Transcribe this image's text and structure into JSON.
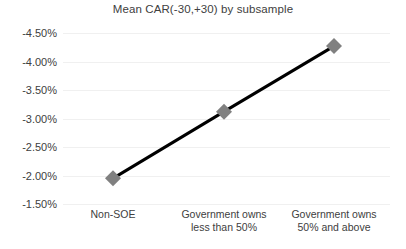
{
  "chart_data": {
    "type": "line",
    "title": "Mean CAR(-30,+30) by subsample",
    "xlabel": "",
    "ylabel": "",
    "categories": [
      "Non-SOE",
      "Government owns less than 50%",
      "Government owns 50% and above"
    ],
    "category_lines": [
      [
        "Non-SOE"
      ],
      [
        "Government owns",
        "less than 50%"
      ],
      [
        "Government owns",
        "50% and above"
      ]
    ],
    "values": [
      -1.95,
      -3.12,
      -4.27
    ],
    "value_labels": [
      "-1.95%",
      "-3.12%",
      "-4.27%"
    ],
    "ylim": [
      -4.5,
      -1.5
    ],
    "ytick_values": [
      -1.5,
      -2.0,
      -2.5,
      -3.0,
      -3.5,
      -4.0,
      -4.5
    ],
    "ytick_labels": [
      "-1.50%",
      "-2.00%",
      "-2.50%",
      "-3.00%",
      "-3.50%",
      "-4.00%",
      "-4.50%"
    ],
    "grid": true,
    "legend": false,
    "legend_position": "none",
    "series": [
      {
        "name": "Mean CAR(-30,+30)",
        "values": [
          -1.95,
          -3.12,
          -4.27
        ],
        "line_color": "#000000",
        "marker_color": "#808080",
        "marker_shape": "diamond"
      }
    ],
    "colors": {
      "line": "#000000",
      "marker": "#808080",
      "gridline": "#f0f0f0",
      "text": "#404040",
      "background": "#ffffff"
    }
  }
}
